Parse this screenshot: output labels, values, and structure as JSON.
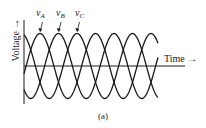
{
  "figure": {
    "caption": "(a)",
    "x_axis_label": "Time",
    "y_axis_label": "Voltage",
    "axis_arrow": "→",
    "phases": [
      {
        "name": "v",
        "sub": "A",
        "phase_deg": 0
      },
      {
        "name": "v",
        "sub": "B",
        "phase_deg": -120
      },
      {
        "name": "v",
        "sub": "C",
        "phase_deg": -240
      }
    ]
  },
  "chart_data": {
    "type": "line",
    "title": "",
    "xlabel": "Time",
    "ylabel": "Voltage",
    "grid": false,
    "legend": "inline labels above first peaks",
    "series": [
      {
        "name": "vA",
        "function": "sin(wt)",
        "amplitude": 1,
        "phase_deg": 0
      },
      {
        "name": "vB",
        "function": "sin(wt - 120°)",
        "amplitude": 1,
        "phase_deg": -120
      },
      {
        "name": "vC",
        "function": "sin(wt - 240°)",
        "amplitude": 1,
        "phase_deg": -240
      }
    ],
    "cycles_shown": 2.4,
    "ylim": [
      -1,
      1
    ]
  }
}
